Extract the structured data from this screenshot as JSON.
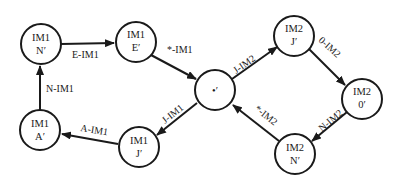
{
  "diagram": {
    "type": "state-transition-graph",
    "colors": {
      "stroke": "#1a1a1a",
      "fill": "#ffffff",
      "background": "#ffffff"
    },
    "nodes": [
      {
        "id": "im1_n",
        "line1": "IM1",
        "line2": "N′",
        "x": 41,
        "y": 44
      },
      {
        "id": "im1_e",
        "line1": "IM1",
        "line2": "E′",
        "x": 136,
        "y": 42
      },
      {
        "id": "star",
        "line1": "",
        "line2": "•′",
        "x": 215,
        "y": 90
      },
      {
        "id": "im2_j",
        "line1": "IM2",
        "line2": "J′",
        "x": 294,
        "y": 36
      },
      {
        "id": "im2_0",
        "line1": "IM2",
        "line2": "0′",
        "x": 362,
        "y": 99
      },
      {
        "id": "im2_n",
        "line1": "IM2",
        "line2": "N′",
        "x": 295,
        "y": 154
      },
      {
        "id": "im1_j",
        "line1": "IM1",
        "line2": "J′",
        "x": 139,
        "y": 147
      },
      {
        "id": "im1_a",
        "line1": "IM1",
        "line2": "A′",
        "x": 40,
        "y": 130
      }
    ],
    "edges": [
      {
        "from": "im1_n",
        "to": "im1_e",
        "label": "E-IM1"
      },
      {
        "from": "im1_e",
        "to": "star",
        "label": "*-IM1"
      },
      {
        "from": "star",
        "to": "im2_j",
        "label": "J-IM2"
      },
      {
        "from": "im2_j",
        "to": "im2_0",
        "label": "0-IM2"
      },
      {
        "from": "im2_0",
        "to": "im2_n",
        "label": "N-IM2"
      },
      {
        "from": "im2_n",
        "to": "star",
        "label": "*-IM2"
      },
      {
        "from": "star",
        "to": "im1_j",
        "label": "J-IM1"
      },
      {
        "from": "im1_j",
        "to": "im1_a",
        "label": "A-IM1"
      },
      {
        "from": "im1_a",
        "to": "im1_n",
        "label": "N-IM1"
      }
    ]
  }
}
